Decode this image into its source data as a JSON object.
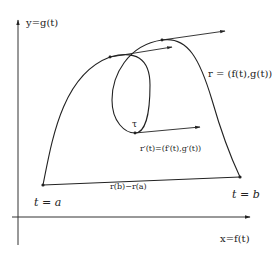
{
  "axes": {
    "y_label": "y=g(t)",
    "x_label": "x=f(t)"
  },
  "curve": {
    "label": "r = (f(t),g(t))",
    "start_label": "t = a",
    "end_label": "t = b",
    "loop_point_label": "τ"
  },
  "chord": {
    "label": "r(b)−r(a)"
  },
  "derivative": {
    "label": "r′(t)=(f′(t),g′(t))"
  },
  "colors": {
    "stroke": "#222222",
    "background": "#ffffff"
  }
}
